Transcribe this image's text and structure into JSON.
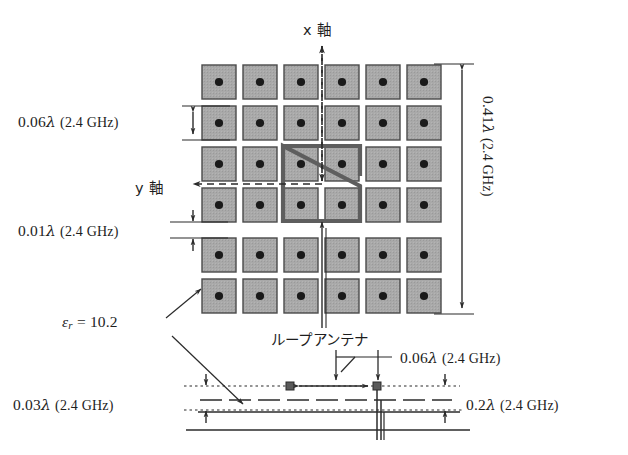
{
  "figure": {
    "type": "antenna-structure-diagram",
    "colors": {
      "patch_fill": "#a8a8a8",
      "patch_edge": "#4a4a4a",
      "via_dot": "#1a1a1a",
      "loop_outline": "#5a5a5a",
      "line": "#2b2b2b",
      "background": "#ffffff"
    }
  },
  "top_view": {
    "axis_x_label": "x 軸",
    "axis_y_label": "y 軸",
    "grid": {
      "columns": 6,
      "rows": 6,
      "cell_pitch_px": 41,
      "patch_size_px": 34
    },
    "loop_antenna_label": "ループアンテナ",
    "permittivity_label": "ε",
    "permittivity_sub": "r",
    "permittivity_value": "= 10.2"
  },
  "dimensions": {
    "patch_width": {
      "value": "0.06",
      "lambda": "λ",
      "freq": "(2.4 GHz)"
    },
    "gap": {
      "value": "0.01",
      "lambda": "λ",
      "freq": "(2.4 GHz)"
    },
    "array_size": {
      "value": "0.41",
      "lambda": "λ",
      "freq": "(2.4 GHz)"
    },
    "substrate_height": {
      "value": "0.03",
      "lambda": "λ",
      "freq": "(2.4 GHz)"
    },
    "feed_offset": {
      "value": "0.06",
      "lambda": "λ",
      "freq": "(2.4 GHz)"
    },
    "ground_spacing": {
      "value": "0.2",
      "lambda": "λ",
      "freq": "(2.4 GHz)"
    }
  }
}
